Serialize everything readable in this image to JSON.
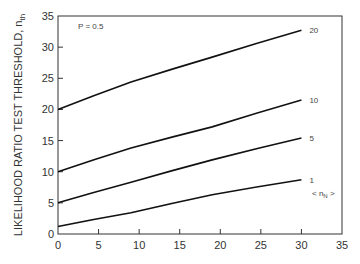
{
  "chart_data": {
    "type": "line",
    "title": "",
    "annotation": "P = 0.5",
    "xlabel": "",
    "ylabel": "LIKELIHOOD RATIO TEST THRESHOLD, n",
    "ylabel_sub": "th",
    "xlim": [
      0,
      35
    ],
    "ylim": [
      0,
      35
    ],
    "xticks": [
      0,
      5,
      10,
      15,
      20,
      25,
      30,
      35
    ],
    "yticks": [
      0,
      5,
      10,
      15,
      20,
      25,
      30,
      35
    ],
    "grid": false,
    "legend_title": "< n",
    "legend_title_sub": "N",
    "legend_title_end": " >",
    "series": [
      {
        "name": "20",
        "x": [
          0,
          9,
          19,
          30
        ],
        "y": [
          20,
          24.4,
          28.4,
          32.7
        ]
      },
      {
        "name": "10",
        "x": [
          0,
          9,
          19,
          30
        ],
        "y": [
          10,
          13.8,
          17.2,
          21.5
        ]
      },
      {
        "name": "5",
        "x": [
          0,
          9,
          19,
          30
        ],
        "y": [
          5,
          8.3,
          11.9,
          15.4
        ]
      },
      {
        "name": "1",
        "x": [
          0,
          9,
          19,
          30
        ],
        "y": [
          1.2,
          3.4,
          6.3,
          8.7
        ]
      }
    ]
  }
}
